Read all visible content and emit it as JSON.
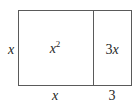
{
  "diagram": {
    "type": "area-model",
    "regions": [
      {
        "id": "square",
        "label_base": "x",
        "label_exp": "2",
        "width_label": "x",
        "height_label": "x"
      },
      {
        "id": "strip",
        "label": "3x",
        "width_label": "3",
        "height_label": "x"
      }
    ],
    "side_labels": {
      "left": "x",
      "bottom_left": "x",
      "bottom_right": "3"
    },
    "inner_labels": {
      "square_base": "x",
      "square_exp": "2",
      "strip_coef": "3",
      "strip_var": "x"
    },
    "colors": {
      "line": "#5a5a5a",
      "text": "#262626",
      "background": "#ffffff"
    }
  }
}
